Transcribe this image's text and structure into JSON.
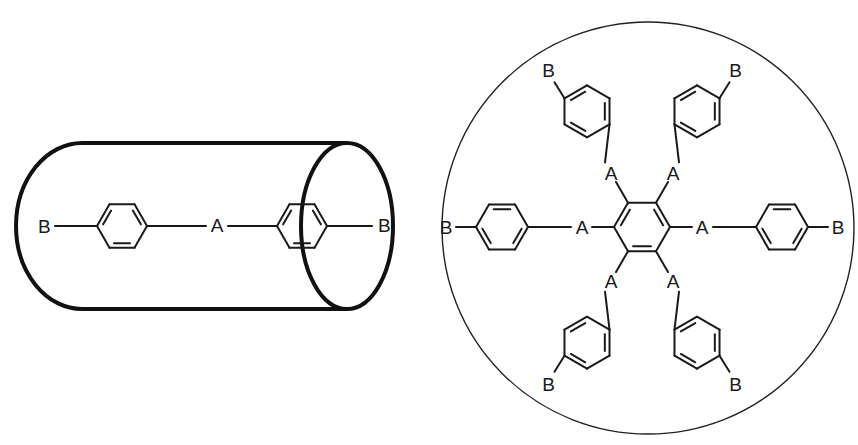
{
  "diagram": {
    "rod": {
      "name": "rod-like-molecule",
      "envelope": "cylinder",
      "labels": {
        "left_end": "B",
        "linker": "A",
        "right_end": "B"
      }
    },
    "disc": {
      "name": "disc-like-molecule",
      "envelope": "circle",
      "core": "benzene",
      "arm_count": 6,
      "linker_label": "A",
      "end_label": "B",
      "arms": [
        {
          "direction": "upper-left",
          "linker": "A",
          "end": "B"
        },
        {
          "direction": "upper-right",
          "linker": "A",
          "end": "B"
        },
        {
          "direction": "right",
          "linker": "A",
          "end": "B"
        },
        {
          "direction": "lower-right",
          "linker": "A",
          "end": "B"
        },
        {
          "direction": "lower-left",
          "linker": "A",
          "end": "B"
        },
        {
          "direction": "left",
          "linker": "A",
          "end": "B"
        }
      ]
    }
  }
}
